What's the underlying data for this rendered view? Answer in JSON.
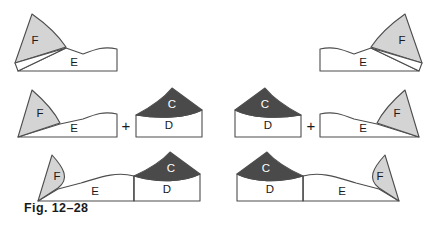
{
  "figure": {
    "caption": "Fig. 12–28",
    "background_color": "#ffffff",
    "stroke_color": "#4d4d4d",
    "labels": {
      "C": "C",
      "D": "D",
      "E": "E",
      "F": "F",
      "plus": "+"
    },
    "fills": {
      "light_gray": "#d4d4d4",
      "dark_gray": "#4a4a4a",
      "white": "#ffffff"
    },
    "rows": [
      {
        "name": "row-1-single-segment",
        "items": [
          {
            "name": "left-segment",
            "regions": [
              "F",
              "E"
            ],
            "F_fill": "#d4d4d4",
            "E_fill": "#ffffff"
          },
          {
            "name": "right-segment",
            "regions": [
              "E",
              "F"
            ],
            "F_fill": "#d4d4d4",
            "E_fill": "#ffffff"
          }
        ]
      },
      {
        "name": "row-2-sum-of-parts",
        "items": [
          {
            "name": "left-sum",
            "parts": [
              "F-E-block",
              "C-D-block"
            ],
            "operator": "+"
          },
          {
            "name": "right-sum",
            "parts": [
              "C-D-block",
              "E-F-block"
            ],
            "operator": "+"
          }
        ]
      },
      {
        "name": "row-3-combined",
        "items": [
          {
            "name": "left-combined",
            "regions": [
              "F",
              "E",
              "D",
              "C"
            ]
          },
          {
            "name": "right-combined",
            "regions": [
              "C",
              "D",
              "E",
              "F"
            ]
          }
        ]
      }
    ]
  }
}
